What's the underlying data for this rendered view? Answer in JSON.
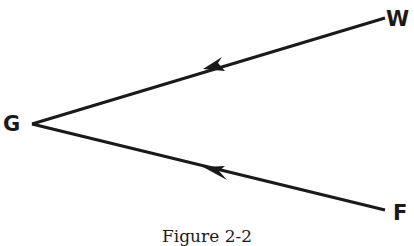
{
  "diagram": {
    "nodes": [
      {
        "id": "G",
        "label": "G",
        "x": 28,
        "y": 125
      },
      {
        "id": "W",
        "label": "W",
        "x": 388,
        "y": 16
      },
      {
        "id": "F",
        "label": "F",
        "x": 390,
        "y": 211
      }
    ],
    "edges": [
      {
        "from": "W",
        "to": "G",
        "arrow_direction": "toward G"
      },
      {
        "from": "F",
        "to": "G",
        "arrow_direction": "toward G"
      }
    ],
    "caption": "Figure 2-2"
  }
}
